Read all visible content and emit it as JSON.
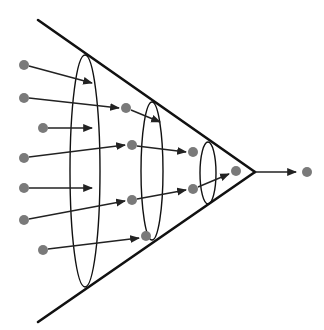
{
  "diagram": {
    "type": "funnel-convergence",
    "colors": {
      "background": "#ffffff",
      "line": "#111111",
      "arrow": "#222222",
      "dot": "#7a7a7a"
    },
    "funnel": {
      "top_line": [
        38,
        20,
        255,
        172
      ],
      "bottom_line": [
        38,
        322,
        255,
        172
      ],
      "apex": [
        255,
        172
      ]
    },
    "ellipses": [
      {
        "name": "stage-1-ellipse",
        "cx": 85,
        "cy": 171,
        "rx": 15,
        "ry": 116
      },
      {
        "name": "stage-2-ellipse",
        "cx": 152,
        "cy": 171,
        "rx": 11,
        "ry": 69
      },
      {
        "name": "stage-3-ellipse",
        "cx": 208,
        "cy": 173,
        "rx": 8,
        "ry": 31
      }
    ],
    "dots": [
      {
        "name": "input-dot-1",
        "x": 24,
        "y": 65
      },
      {
        "name": "input-dot-2",
        "x": 24,
        "y": 98
      },
      {
        "name": "input-dot-3",
        "x": 43,
        "y": 128
      },
      {
        "name": "input-dot-4",
        "x": 24,
        "y": 158
      },
      {
        "name": "input-dot-5",
        "x": 24,
        "y": 188
      },
      {
        "name": "input-dot-6",
        "x": 24,
        "y": 220
      },
      {
        "name": "input-dot-7",
        "x": 43,
        "y": 250
      },
      {
        "name": "stage-1-dot-1",
        "x": 126,
        "y": 108
      },
      {
        "name": "stage-1-dot-2",
        "x": 132,
        "y": 145
      },
      {
        "name": "stage-1-dot-3",
        "x": 132,
        "y": 200
      },
      {
        "name": "stage-1-dot-4",
        "x": 146,
        "y": 236
      },
      {
        "name": "stage-2-dot-1",
        "x": 193,
        "y": 152
      },
      {
        "name": "stage-2-dot-2",
        "x": 193,
        "y": 189
      },
      {
        "name": "stage-3-dot",
        "x": 236,
        "y": 171
      },
      {
        "name": "output-dot",
        "x": 307,
        "y": 172
      }
    ],
    "arrows": [
      {
        "name": "arrow-1",
        "x1": 29,
        "y1": 66,
        "x2": 92,
        "y2": 83
      },
      {
        "name": "arrow-2",
        "x1": 29,
        "y1": 98,
        "x2": 119,
        "y2": 108
      },
      {
        "name": "arrow-3",
        "x1": 48,
        "y1": 128,
        "x2": 92,
        "y2": 128
      },
      {
        "name": "arrow-4",
        "x1": 29,
        "y1": 157,
        "x2": 125,
        "y2": 145
      },
      {
        "name": "arrow-5",
        "x1": 29,
        "y1": 188,
        "x2": 92,
        "y2": 188
      },
      {
        "name": "arrow-6",
        "x1": 29,
        "y1": 219,
        "x2": 125,
        "y2": 201
      },
      {
        "name": "arrow-7",
        "x1": 48,
        "y1": 249,
        "x2": 139,
        "y2": 238
      },
      {
        "name": "arrow-8",
        "x1": 131,
        "y1": 110,
        "x2": 160,
        "y2": 122
      },
      {
        "name": "arrow-9",
        "x1": 137,
        "y1": 146,
        "x2": 186,
        "y2": 152
      },
      {
        "name": "arrow-10",
        "x1": 137,
        "y1": 199,
        "x2": 186,
        "y2": 190
      },
      {
        "name": "arrow-11",
        "x1": 198,
        "y1": 187,
        "x2": 229,
        "y2": 174
      },
      {
        "name": "output-arrow",
        "x1": 255,
        "y1": 172,
        "x2": 296,
        "y2": 172
      }
    ]
  }
}
